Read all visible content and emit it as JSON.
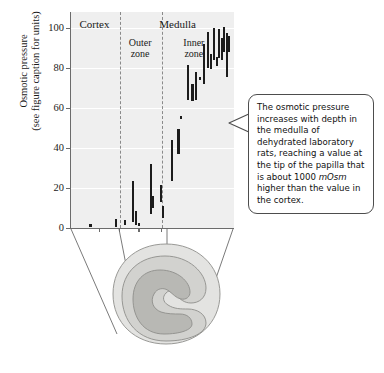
{
  "figure": {
    "title_visible": false,
    "background_color": "#ffffff",
    "plot_background_color": "#efefef",
    "axis_color": "#6b6b6b",
    "data_color": "#1c1c1c"
  },
  "y_axis": {
    "title_line1": "Osmotic pressure",
    "title_line2": "(see figure caption for units)",
    "ticks": [
      0,
      20,
      40,
      60,
      80,
      100
    ],
    "min": 0,
    "max": 108
  },
  "zones": {
    "cortex_label": "Cortex",
    "medulla_label": "Medulla",
    "outer_zone_label_line1": "Outer",
    "outer_zone_label_line2": "zone",
    "inner_zone_label_line1": "Inner",
    "inner_zone_label_line2": "zone"
  },
  "callout": {
    "text_part1": "The osmotic pressure increases with depth in the medulla of dehydrated laboratory rats, reaching a value at the tip of the papilla that is about 1000 ",
    "text_italic": "mOsm",
    "text_part2": " higher than the value in the cortex."
  },
  "diagram": {
    "name": "kidney-cross-section",
    "outer_fill": "#e3e3e1",
    "middle_fill": "#d2d2cf",
    "inner_fill": "#b8b8b4",
    "outline_color": "#8f8f8b"
  },
  "chart_data": {
    "type": "scatter",
    "title": "",
    "xlabel": "",
    "ylabel": "Osmotic pressure (see figure caption for units)",
    "ylim": [
      0,
      108
    ],
    "xlim": [
      0,
      100
    ],
    "grid": true,
    "legend": null,
    "annotations": [
      {
        "text": "The osmotic pressure increases with depth in the medulla of dehydrated laboratory rats, reaching a value at the tip of the papilla that is about 1000 mOsm higher than the value in the cortex.",
        "type": "callout-box"
      }
    ],
    "zone_boundaries": [
      {
        "label": "Cortex",
        "x_start": 0,
        "x_end": 30
      },
      {
        "label": "Outer zone",
        "x_start": 30,
        "x_end": 56,
        "parent": "Medulla"
      },
      {
        "label": "Inner zone",
        "x_start": 56,
        "x_end": 100,
        "parent": "Medulla"
      }
    ],
    "note": "Each datum is a vertical range bar (low-high) at a given depth x (0 = cortex surface, 100 = papilla tip).",
    "points": [
      {
        "x": 12.0,
        "low": 0.5,
        "high": 2.0
      },
      {
        "x": 27.5,
        "low": 0.5,
        "high": 4.5
      },
      {
        "x": 33.0,
        "low": 1.5,
        "high": 4.0
      },
      {
        "x": 38.0,
        "low": 3.0,
        "high": 23.5
      },
      {
        "x": 40.0,
        "low": 1.5,
        "high": 8.5
      },
      {
        "x": 41.5,
        "low": 1.0,
        "high": 2.5
      },
      {
        "x": 49.0,
        "low": 7.0,
        "high": 32.0
      },
      {
        "x": 50.0,
        "low": 10.0,
        "high": 16.0
      },
      {
        "x": 55.0,
        "low": 13.0,
        "high": 21.5
      },
      {
        "x": 56.5,
        "low": 5.0,
        "high": 11.0
      },
      {
        "x": 62.0,
        "low": 23.5,
        "high": 44.0
      },
      {
        "x": 66.0,
        "low": 37.0,
        "high": 49.5
      },
      {
        "x": 67.5,
        "low": 54.5,
        "high": 56.0
      },
      {
        "x": 72.0,
        "low": 64.0,
        "high": 81.5
      },
      {
        "x": 74.5,
        "low": 63.5,
        "high": 72.0
      },
      {
        "x": 76.5,
        "low": 64.0,
        "high": 78.0
      },
      {
        "x": 79.0,
        "low": 74.0,
        "high": 75.5
      },
      {
        "x": 81.5,
        "low": 72.0,
        "high": 92.0
      },
      {
        "x": 84.0,
        "low": 80.0,
        "high": 98.0
      },
      {
        "x": 86.0,
        "low": 79.5,
        "high": 87.0
      },
      {
        "x": 87.5,
        "low": 84.0,
        "high": 100.0
      },
      {
        "x": 89.5,
        "low": 81.0,
        "high": 85.5
      },
      {
        "x": 91.0,
        "low": 85.0,
        "high": 99.5
      },
      {
        "x": 92.5,
        "low": 84.0,
        "high": 95.0
      },
      {
        "x": 94.0,
        "low": 88.0,
        "high": 100.5
      },
      {
        "x": 95.5,
        "low": 75.5,
        "high": 97.5
      },
      {
        "x": 97.0,
        "low": 88.0,
        "high": 96.0
      }
    ]
  }
}
